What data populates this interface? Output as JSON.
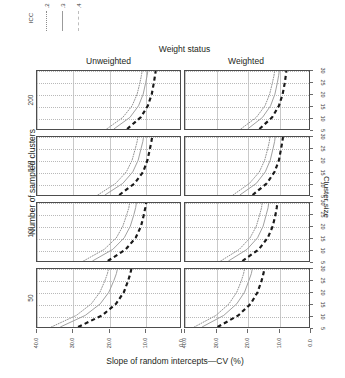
{
  "legend": {
    "title": "ICC",
    "entries": [
      {
        "label": ".2",
        "style": "dotted"
      },
      {
        "label": ".3",
        "style": "solid"
      },
      {
        "label": ".4",
        "style": "dashed"
      }
    ]
  },
  "facet": {
    "column_super_title": "Weight status",
    "columns": [
      {
        "label": "Unweighted"
      },
      {
        "label": "Weighted"
      }
    ],
    "row_axis_title": "Number of sampled clusters",
    "rows": [
      {
        "label": "200"
      },
      {
        "label": "150"
      },
      {
        "label": "100"
      },
      {
        "label": "50"
      }
    ]
  },
  "axes": {
    "x_title": "Slope of random intercepts—CV (%)",
    "x_ticks": [
      "40.0",
      "30.0",
      "20.0",
      "10.0",
      "0.0"
    ],
    "x_reversed": true,
    "y_title": "Cluster size",
    "y_ticks": [
      "5",
      "10",
      "15",
      "20",
      "25",
      "30"
    ]
  },
  "chart_data": {
    "type": "line",
    "title": "Weight status",
    "xlabel": "Slope of random intercepts—CV (%)",
    "ylabel": "Cluster size",
    "xlim": [
      40.0,
      0.0
    ],
    "ylim": [
      5,
      30
    ],
    "grid": true,
    "legend_position": "top-left",
    "legend_title": "ICC",
    "facet_rows": [
      "200",
      "150",
      "100",
      "50"
    ],
    "facet_row_label": "Number of sampled clusters",
    "facet_cols": [
      "Unweighted",
      "Weighted"
    ],
    "facet_col_label": "Weight status",
    "series": [
      {
        "name": ".2",
        "style": "dotted",
        "panels": {
          "200|Unweighted": {
            "x": [
              20.5,
              16.0,
              13.4,
              12.0,
              11.2,
              10.8,
              10.6
            ],
            "y": [
              5,
              10,
              15,
              20,
              25,
              28,
              30
            ]
          },
          "200|Weighted": {
            "x": [
              22.0,
              17.0,
              14.2,
              12.7,
              11.8,
              11.3,
              11.1
            ],
            "y": [
              5,
              10,
              15,
              20,
              25,
              28,
              30
            ]
          },
          "150|Unweighted": {
            "x": [
              23.0,
              18.0,
              15.0,
              13.4,
              12.5,
              12.0,
              11.8
            ],
            "y": [
              5,
              10,
              15,
              20,
              25,
              28,
              30
            ]
          },
          "150|Weighted": {
            "x": [
              24.5,
              19.2,
              16.0,
              14.3,
              13.3,
              12.8,
              12.6
            ],
            "y": [
              5,
              10,
              15,
              20,
              25,
              28,
              30
            ]
          },
          "100|Unweighted": {
            "x": [
              27.0,
              21.2,
              17.8,
              16.0,
              14.9,
              14.3,
              14.1
            ],
            "y": [
              5,
              10,
              15,
              20,
              25,
              28,
              30
            ]
          },
          "100|Weighted": {
            "x": [
              28.5,
              22.5,
              19.0,
              17.0,
              15.9,
              15.3,
              15.1
            ],
            "y": [
              5,
              10,
              15,
              20,
              25,
              28,
              30
            ]
          },
          "50|Unweighted": {
            "x": [
              36.0,
              29.0,
              24.8,
              22.4,
              21.0,
              20.3,
              20.0
            ],
            "y": [
              5,
              10,
              15,
              20,
              25,
              28,
              30
            ]
          },
          "50|Weighted": {
            "x": [
              37.0,
              30.0,
              25.8,
              23.3,
              21.8,
              21.1,
              20.8
            ],
            "y": [
              5,
              10,
              15,
              20,
              25,
              28,
              30
            ]
          }
        }
      },
      {
        "name": ".3",
        "style": "solid",
        "panels": {
          "200|Unweighted": {
            "x": [
              18.5,
              14.0,
              11.6,
              10.3,
              9.6,
              9.2,
              9.0
            ],
            "y": [
              5,
              10,
              15,
              20,
              25,
              28,
              30
            ]
          },
          "200|Weighted": {
            "x": [
              19.8,
              15.0,
              12.4,
              11.0,
              10.2,
              9.8,
              9.6
            ],
            "y": [
              5,
              10,
              15,
              20,
              25,
              28,
              30
            ]
          },
          "150|Unweighted": {
            "x": [
              21.0,
              16.0,
              13.2,
              11.7,
              10.9,
              10.4,
              10.2
            ],
            "y": [
              5,
              10,
              15,
              20,
              25,
              28,
              30
            ]
          },
          "150|Weighted": {
            "x": [
              22.3,
              17.0,
              14.1,
              12.5,
              11.6,
              11.1,
              10.9
            ],
            "y": [
              5,
              10,
              15,
              20,
              25,
              28,
              30
            ]
          },
          "100|Unweighted": {
            "x": [
              24.5,
              18.8,
              15.6,
              13.9,
              12.9,
              12.4,
              12.2
            ],
            "y": [
              5,
              10,
              15,
              20,
              25,
              28,
              30
            ]
          },
          "100|Weighted": {
            "x": [
              26.0,
              20.0,
              16.6,
              14.8,
              13.8,
              13.2,
              13.0
            ],
            "y": [
              5,
              10,
              15,
              20,
              25,
              28,
              30
            ]
          },
          "50|Unweighted": {
            "x": [
              33.5,
              26.5,
              22.3,
              19.9,
              18.5,
              17.8,
              17.5
            ],
            "y": [
              5,
              10,
              15,
              20,
              25,
              28,
              30
            ]
          },
          "50|Weighted": {
            "x": [
              34.5,
              27.5,
              23.3,
              20.8,
              19.4,
              18.6,
              18.3
            ],
            "y": [
              5,
              10,
              15,
              20,
              25,
              28,
              30
            ]
          }
        }
      },
      {
        "name": ".4",
        "style": "dashed",
        "panels": {
          "200|Unweighted": {
            "x": [
              14.8,
              11.0,
              9.0,
              7.9,
              7.3,
              7.0,
              6.8
            ],
            "y": [
              5,
              10,
              15,
              20,
              25,
              28,
              30
            ]
          },
          "200|Weighted": {
            "x": [
              16.0,
              11.9,
              9.7,
              8.5,
              7.8,
              7.5,
              7.3
            ],
            "y": [
              5,
              10,
              15,
              20,
              25,
              28,
              30
            ]
          },
          "150|Unweighted": {
            "x": [
              17.0,
              12.7,
              10.3,
              9.1,
              8.4,
              8.0,
              7.8
            ],
            "y": [
              5,
              10,
              15,
              20,
              25,
              28,
              30
            ]
          },
          "150|Weighted": {
            "x": [
              18.2,
              13.6,
              11.1,
              9.7,
              9.0,
              8.6,
              8.4
            ],
            "y": [
              5,
              10,
              15,
              20,
              25,
              28,
              30
            ]
          },
          "100|Unweighted": {
            "x": [
              20.2,
              15.2,
              12.4,
              10.9,
              10.1,
              9.7,
              9.5
            ],
            "y": [
              5,
              10,
              15,
              20,
              25,
              28,
              30
            ]
          },
          "100|Weighted": {
            "x": [
              21.5,
              16.2,
              13.3,
              11.7,
              10.8,
              10.4,
              10.2
            ],
            "y": [
              5,
              10,
              15,
              20,
              25,
              28,
              30
            ]
          },
          "50|Unweighted": {
            "x": [
              28.5,
              21.8,
              17.9,
              15.7,
              14.5,
              13.9,
              13.6
            ],
            "y": [
              5,
              10,
              15,
              20,
              25,
              28,
              30
            ]
          },
          "50|Weighted": {
            "x": [
              29.5,
              22.8,
              18.8,
              16.6,
              15.3,
              14.7,
              14.4
            ],
            "y": [
              5,
              10,
              15,
              20,
              25,
              28,
              30
            ]
          }
        }
      }
    ]
  }
}
